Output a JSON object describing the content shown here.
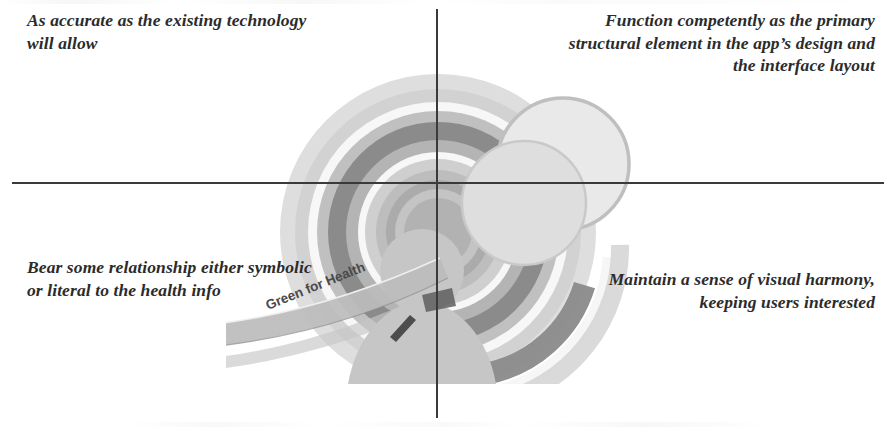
{
  "diagram": {
    "type": "quadrant-crosshair",
    "axes": {
      "horizontal_color": "#3a3a3a",
      "vertical_color": "#3a3a3a"
    },
    "quadrants": [
      {
        "position": "top-left",
        "text": "As accurate as the existing technology will allow"
      },
      {
        "position": "top-right",
        "text": "Function competently as the primary structural element in the app’s design and the interface layout"
      },
      {
        "position": "bottom-left",
        "text": "Bear some relationship either symbolic or literal to the health info"
      },
      {
        "position": "bottom-right",
        "text": "Maintain a sense of visual harmony, keeping users interested"
      }
    ]
  },
  "graphic": {
    "name": "concentric-rings-illustration",
    "ribbon_label": "Green for Health",
    "elements": [
      "concentric-rings",
      "person-silhouette",
      "bubble-circle-large",
      "bubble-circle-small",
      "ribbon-banner"
    ],
    "palette": {
      "ring_lightest": "#d8d8d8",
      "ring_light": "#c9c9c9",
      "ring_mid": "#aeaeae",
      "ring_dark": "#8d8d8d",
      "ring_darkest": "#6f6f6f",
      "highlight_white": "#f6f6f6",
      "silhouette": "#c2c2c2",
      "bubble_large": "#e8e8e8",
      "bubble_small": "#dcdcdc",
      "ribbon": "#b9b9b9"
    }
  }
}
